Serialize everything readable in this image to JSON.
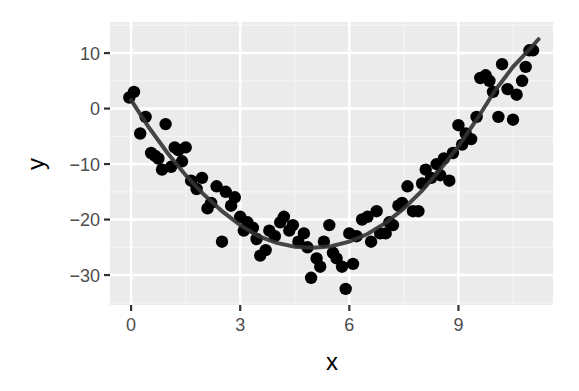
{
  "chart_data": {
    "type": "scatter",
    "title": "",
    "xlabel": "x",
    "ylabel": "y",
    "xlim": [
      -0.58,
      11.6
    ],
    "ylim": [
      -35.4,
      15.6
    ],
    "x_ticks": [
      0,
      3,
      6,
      9
    ],
    "x_tick_labels": [
      "0",
      "3",
      "6",
      "9"
    ],
    "y_ticks": [
      10,
      0,
      -10,
      -20,
      -30
    ],
    "y_tick_labels": [
      "10",
      "0",
      "−10",
      "−20",
      "−30"
    ],
    "grid": true,
    "legend": "none",
    "colors": {
      "panel_background": "#ebebeb",
      "grid_major": "#ffffff",
      "grid_minor": "#f5f5f5",
      "points": "#000000",
      "smooth_line": "#333333"
    },
    "series": [
      {
        "name": "points",
        "kind": "scatter",
        "x": [
          -0.05,
          0.08,
          0.25,
          0.4,
          0.55,
          0.65,
          0.75,
          0.85,
          0.95,
          1.1,
          1.2,
          1.3,
          1.4,
          1.5,
          1.65,
          1.8,
          1.95,
          2.1,
          2.2,
          2.35,
          2.5,
          2.6,
          2.75,
          2.85,
          3.0,
          3.1,
          3.2,
          3.35,
          3.45,
          3.55,
          3.7,
          3.8,
          3.95,
          4.1,
          4.2,
          4.35,
          4.45,
          4.6,
          4.75,
          4.85,
          4.95,
          5.1,
          5.2,
          5.3,
          5.45,
          5.55,
          5.65,
          5.8,
          5.9,
          6.0,
          6.1,
          6.2,
          6.35,
          6.5,
          6.6,
          6.75,
          6.85,
          7.0,
          7.1,
          7.2,
          7.35,
          7.45,
          7.6,
          7.75,
          7.9,
          8.0,
          8.1,
          8.25,
          8.4,
          8.5,
          8.6,
          8.75,
          8.85,
          9.0,
          9.1,
          9.2,
          9.35,
          9.5,
          9.6,
          9.75,
          9.85,
          9.95,
          10.1,
          10.2,
          10.35,
          10.5,
          10.6,
          10.75,
          10.85,
          10.95,
          11.05
        ],
        "y": [
          2.0,
          3.0,
          -4.5,
          -1.5,
          -8.0,
          -8.5,
          -9.0,
          -11.0,
          -2.8,
          -10.5,
          -7.0,
          -7.5,
          -9.5,
          -7.0,
          -13.0,
          -14.5,
          -12.5,
          -18.0,
          -17.0,
          -14.0,
          -24.0,
          -15.0,
          -17.5,
          -16.0,
          -19.5,
          -22.0,
          -20.5,
          -21.5,
          -23.5,
          -26.5,
          -25.5,
          -22.0,
          -23.0,
          -20.5,
          -19.5,
          -22.0,
          -21.0,
          -24.0,
          -22.5,
          -25.0,
          -30.5,
          -27.0,
          -28.5,
          -24.0,
          -21.0,
          -26.0,
          -27.0,
          -28.5,
          -32.5,
          -22.5,
          -28.0,
          -23.0,
          -20.0,
          -19.5,
          -24.0,
          -18.5,
          -22.5,
          -22.5,
          -20.5,
          -21.0,
          -17.5,
          -17.0,
          -14.0,
          -18.5,
          -18.5,
          -13.5,
          -11.0,
          -12.5,
          -10.0,
          -12.0,
          -9.0,
          -13.0,
          -8.0,
          -3.0,
          -6.5,
          -4.5,
          -5.5,
          -1.5,
          5.5,
          6.0,
          5.0,
          3.0,
          -1.5,
          8.0,
          3.5,
          -2.0,
          2.5,
          5.0,
          7.5,
          10.5,
          10.5
        ]
      },
      {
        "name": "smooth",
        "kind": "line",
        "x": [
          0,
          0.5,
          1,
          1.5,
          2,
          2.5,
          3,
          3.5,
          4,
          4.5,
          5,
          5.5,
          6,
          6.5,
          7,
          7.5,
          8,
          8.5,
          9,
          9.5,
          10,
          10.5,
          11,
          11.2
        ],
        "y": [
          1.5,
          -3.5,
          -8.0,
          -12.0,
          -15.5,
          -18.5,
          -21.0,
          -23.0,
          -24.2,
          -24.9,
          -25.1,
          -24.8,
          -24.0,
          -22.6,
          -20.6,
          -18.0,
          -14.8,
          -11.0,
          -6.8,
          -2.0,
          3.2,
          7.5,
          11.0,
          12.5
        ]
      }
    ]
  }
}
